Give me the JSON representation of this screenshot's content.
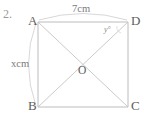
{
  "figure": {
    "question_number": "2.",
    "shape_name": "square",
    "vertices": [
      {
        "id": "A",
        "label": "A",
        "x": 38,
        "y": 22,
        "label_x": 28,
        "label_y": 15
      },
      {
        "id": "D",
        "label": "D",
        "x": 128,
        "y": 22,
        "label_x": 130,
        "label_y": 15
      },
      {
        "id": "B",
        "label": "B",
        "x": 38,
        "y": 107,
        "label_x": 28,
        "label_y": 100
      },
      {
        "id": "C",
        "label": "C",
        "x": 128,
        "y": 107,
        "label_x": 130,
        "label_y": 100
      }
    ],
    "center": {
      "id": "O",
      "label": "O",
      "x": 83,
      "y": 64,
      "label_x": 78,
      "label_y": 66
    },
    "side_labels": [
      {
        "name": "top-side-length",
        "text": "7cm",
        "side": "AD",
        "x": 72,
        "y": 5
      },
      {
        "name": "left-side-length",
        "text": "xcm",
        "side": "AB",
        "x": 12,
        "y": 60
      }
    ],
    "angle_labels": [
      {
        "name": "angle-adb",
        "text": "y°",
        "at_vertex": "D",
        "x": 104,
        "y": 26
      }
    ],
    "colors": {
      "stroke": "#b9b9b9",
      "diagonal_stroke": "#c2c2c2",
      "arc_stroke": "#cfcfcf",
      "text": "#6b6b6b",
      "background": "#ffffff"
    }
  }
}
